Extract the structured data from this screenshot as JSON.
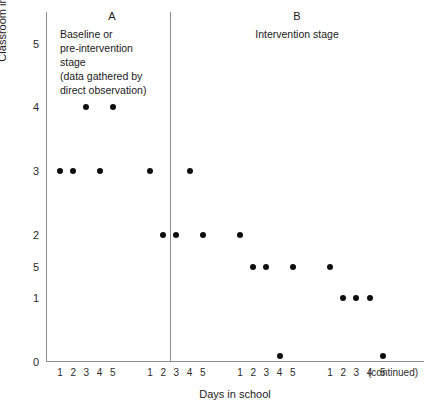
{
  "chart_data": {
    "type": "scatter",
    "title": "",
    "xlabel": "Days in school",
    "ylabel": "Classroom incidents per day",
    "ylabel_superscript": "a",
    "ylim": [
      0,
      5.5
    ],
    "grid": false,
    "legend": false,
    "y_ticks": [
      {
        "label": "5",
        "value": 5
      },
      {
        "label": "4",
        "value": 4
      },
      {
        "label": "3",
        "value": 3
      },
      {
        "label": "2",
        "value": 2
      },
      {
        "label": "5",
        "value": 1.5
      },
      {
        "label": "1",
        "value": 1
      },
      {
        "label": "0",
        "value": 0
      }
    ],
    "x_tick_groups": [
      {
        "labels": [
          "1",
          "2",
          "3",
          "4",
          "5"
        ]
      },
      {
        "labels": [
          "1",
          "2",
          "3",
          "4",
          "5"
        ]
      },
      {
        "labels": [
          "1",
          "2",
          "3",
          "4",
          "5"
        ]
      },
      {
        "labels": [
          "1",
          "2",
          "3",
          "4",
          "5"
        ]
      }
    ],
    "x_axis_trailing_label": "(continued)",
    "phase_divider_after_index": 7,
    "points": [
      {
        "x": 1,
        "y": 3,
        "week": 1,
        "day": 1,
        "phase": "A"
      },
      {
        "x": 2,
        "y": 3,
        "week": 1,
        "day": 2,
        "phase": "A"
      },
      {
        "x": 3,
        "y": 4,
        "week": 1,
        "day": 3,
        "phase": "A"
      },
      {
        "x": 4,
        "y": 3,
        "week": 1,
        "day": 4,
        "phase": "A"
      },
      {
        "x": 5,
        "y": 4,
        "week": 1,
        "day": 5,
        "phase": "A"
      },
      {
        "x": 6,
        "y": 3,
        "week": 2,
        "day": 1,
        "phase": "A"
      },
      {
        "x": 7,
        "y": 2,
        "week": 2,
        "day": 2,
        "phase": "A"
      },
      {
        "x": 8,
        "y": 2,
        "week": 2,
        "day": 3,
        "phase": "A"
      },
      {
        "x": 9,
        "y": 3,
        "week": 2,
        "day": 4,
        "phase": "B"
      },
      {
        "x": 10,
        "y": 2,
        "week": 2,
        "day": 5,
        "phase": "B"
      },
      {
        "x": 11,
        "y": 2,
        "week": 3,
        "day": 1,
        "phase": "B"
      },
      {
        "x": 12,
        "y": 1.5,
        "week": 3,
        "day": 2,
        "phase": "B"
      },
      {
        "x": 13,
        "y": 1.5,
        "week": 3,
        "day": 3,
        "phase": "B"
      },
      {
        "x": 14,
        "y": 0.1,
        "week": 3,
        "day": 4,
        "phase": "B"
      },
      {
        "x": 15,
        "y": 1.5,
        "week": 3,
        "day": 5,
        "phase": "B"
      },
      {
        "x": 16,
        "y": 1.5,
        "week": 4,
        "day": 1,
        "phase": "B"
      },
      {
        "x": 17,
        "y": 1,
        "week": 4,
        "day": 2,
        "phase": "B"
      },
      {
        "x": 18,
        "y": 1,
        "week": 4,
        "day": 3,
        "phase": "B"
      },
      {
        "x": 19,
        "y": 1,
        "week": 4,
        "day": 4,
        "phase": "B"
      },
      {
        "x": 20,
        "y": 0.1,
        "week": 4,
        "day": 5,
        "phase": "B"
      }
    ]
  },
  "annotations": {
    "phase_a": {
      "letter": "A",
      "description": "Baseline or\npre-intervention\nstage\n(data gathered by\ndirect observation)"
    },
    "phase_b": {
      "letter": "B",
      "description": "Intervention stage"
    }
  },
  "colors": {
    "point": "#0d0d0d",
    "axis": "#8c8c8c",
    "text": "#1a1a1a",
    "background": "#ffffff"
  }
}
